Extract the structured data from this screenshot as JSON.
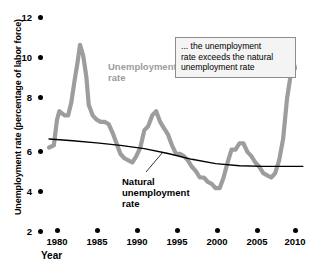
{
  "chart_data": {
    "type": "line",
    "title": "",
    "xlabel": "Year",
    "ylabel": "Unemployment rate (percentage of labor force)",
    "xlim": [
      1978,
      2011
    ],
    "ylim": [
      2,
      12
    ],
    "grid": false,
    "legend_position": "inline-labels",
    "x_ticks": [
      "1980",
      "1985",
      "1990",
      "1995",
      "2000",
      "2005",
      "2010"
    ],
    "x_tick_values": [
      1980,
      1985,
      1990,
      1995,
      2000,
      2005,
      2010
    ],
    "y_ticks": [
      "2",
      "4",
      "6",
      "8",
      "10",
      "12"
    ],
    "y_tick_values": [
      2,
      4,
      6,
      8,
      10,
      12
    ],
    "series": [
      {
        "name": "Unemployment rate",
        "color": "#9d9d9d",
        "x": [
          1979.0,
          1979.6,
          1980.0,
          1980.3,
          1980.6,
          1981.0,
          1981.4,
          1981.8,
          1982.2,
          1982.6,
          1982.9,
          1983.3,
          1983.7,
          1984.0,
          1984.5,
          1985.0,
          1985.5,
          1986.0,
          1986.5,
          1987.0,
          1987.5,
          1988.0,
          1988.5,
          1989.0,
          1989.5,
          1990.0,
          1990.5,
          1991.0,
          1991.5,
          1992.0,
          1992.5,
          1993.0,
          1993.5,
          1994.0,
          1994.5,
          1995.0,
          1995.5,
          1996.0,
          1996.5,
          1997.0,
          1997.5,
          1998.0,
          1998.5,
          1999.0,
          1999.5,
          2000.0,
          2000.5,
          2001.0,
          2001.5,
          2002.0,
          2002.5,
          2003.0,
          2003.5,
          2004.0,
          2004.5,
          2005.0,
          2005.5,
          2006.0,
          2006.5,
          2007.0,
          2007.5,
          2008.0,
          2008.5,
          2009.0,
          2009.5,
          2009.8,
          2010.0
        ],
        "y": [
          5.9,
          6.0,
          7.2,
          7.6,
          7.5,
          7.4,
          7.4,
          8.0,
          9.0,
          9.9,
          10.7,
          10.2,
          9.2,
          7.9,
          7.4,
          7.2,
          7.1,
          7.1,
          7.0,
          6.6,
          6.1,
          5.6,
          5.4,
          5.3,
          5.2,
          5.5,
          5.9,
          6.7,
          6.9,
          7.4,
          7.6,
          7.1,
          6.8,
          6.5,
          6.0,
          5.6,
          5.6,
          5.5,
          5.3,
          5.0,
          4.8,
          4.5,
          4.5,
          4.3,
          4.2,
          4.0,
          4.0,
          4.5,
          5.2,
          5.8,
          5.8,
          6.1,
          6.1,
          5.7,
          5.5,
          5.2,
          5.0,
          4.7,
          4.6,
          4.5,
          4.7,
          5.3,
          6.3,
          8.2,
          9.4,
          9.9,
          9.6
        ]
      },
      {
        "name": "Natural unemployment rate",
        "color": "#000000",
        "x": [
          1979.0,
          1982.0,
          1985.0,
          1988.0,
          1991.0,
          1994.0,
          1997.0,
          2000.0,
          2003.0,
          2006.0,
          2009.0,
          2011.0
        ],
        "y": [
          6.3,
          6.22,
          6.12,
          6.0,
          5.85,
          5.62,
          5.35,
          5.15,
          5.05,
          5.02,
          5.02,
          5.02
        ]
      }
    ],
    "annotations": [
      {
        "name": "callout",
        "lines": [
          "... the unemployment",
          "rate exceeds the natural",
          "unemployment rate"
        ]
      }
    ],
    "series_labels": [
      {
        "name": "unemployment",
        "lines": [
          "Unemployment",
          "rate"
        ]
      },
      {
        "name": "natural",
        "lines": [
          "Natural",
          "unemployment",
          "rate"
        ]
      }
    ]
  },
  "axes": {
    "y_title": "Unemployment rate (percentage of labor force)",
    "x_title": "Year",
    "y_labels": [
      "12",
      "10",
      "8",
      "6",
      "4",
      "2"
    ],
    "x_labels": [
      "1980",
      "1985",
      "1990",
      "1995",
      "2000",
      "2005",
      "2010"
    ]
  },
  "labels": {
    "unemployment_line1": "Unemployment",
    "unemployment_line2": "rate",
    "natural_line1": "Natural",
    "natural_line2": "unemployment",
    "natural_line3": "rate"
  },
  "annotation": {
    "line1": "... the unemployment",
    "line2": "rate exceeds the natural",
    "line3": "unemployment rate"
  },
  "colors": {
    "unemployment_series": "#9d9d9d",
    "natural_series": "#000000",
    "annotation_border": "#8d8d8d",
    "annotation_fill": "#f4f4f4",
    "text": "#000000"
  }
}
